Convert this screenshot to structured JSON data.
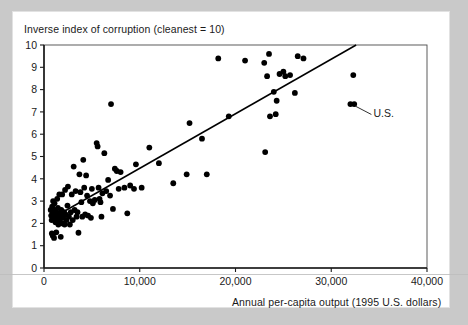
{
  "figure": {
    "background_color": "#ffffff",
    "frame_color": "#c9c9c9",
    "ink_color": "#1a1a1a"
  },
  "chart_data": {
    "type": "scatter",
    "title": "Inverse index of corruption (cleanest = 10)",
    "xlabel": "Annual per-capita output (1995 U.S. dollars)",
    "ylabel": "Inverse index of corruption (cleanest = 10)",
    "xlim": [
      0,
      40000
    ],
    "ylim": [
      0,
      10
    ],
    "xticks": [
      0,
      10000,
      20000,
      30000,
      40000
    ],
    "xticklabels": [
      "0",
      "10,000",
      "20,000",
      "30,000",
      "40,000"
    ],
    "yticks": [
      0,
      1,
      2,
      3,
      4,
      5,
      6,
      7,
      8,
      9,
      10
    ],
    "yticklabels": [
      "0",
      "1",
      "2",
      "3",
      "4",
      "5",
      "6",
      "7",
      "8",
      "9",
      "10"
    ],
    "grid": false,
    "legend": false,
    "marker": {
      "shape": "circle",
      "color": "#000000",
      "size": 4.2
    },
    "trendline": {
      "type": "linear",
      "color": "#000000",
      "x_start": 800,
      "y_start": 2.22,
      "x_end": 32600,
      "y_end": 10.0
    },
    "annotations": [
      {
        "text": "U.S.",
        "points_to_x": 32200,
        "points_to_y": 7.35,
        "label_x": 34400,
        "label_y": 6.75
      }
    ],
    "points": [
      [
        700,
        2.6
      ],
      [
        750,
        2.35
      ],
      [
        800,
        2.15
      ],
      [
        820,
        1.55
      ],
      [
        850,
        2.75
      ],
      [
        900,
        2.45
      ],
      [
        920,
        1.45
      ],
      [
        950,
        3.0
      ],
      [
        980,
        2.25
      ],
      [
        1000,
        2.6
      ],
      [
        1050,
        1.35
      ],
      [
        1100,
        2.9
      ],
      [
        1150,
        2.3
      ],
      [
        1200,
        2.05
      ],
      [
        1250,
        2.55
      ],
      [
        1280,
        1.6
      ],
      [
        1320,
        2.4
      ],
      [
        1380,
        3.1
      ],
      [
        1400,
        2.2
      ],
      [
        1450,
        2.7
      ],
      [
        1500,
        1.95
      ],
      [
        1550,
        2.45
      ],
      [
        1600,
        3.3
      ],
      [
        1650,
        2.15
      ],
      [
        1700,
        2.3
      ],
      [
        1750,
        1.4
      ],
      [
        1800,
        2.6
      ],
      [
        1850,
        2.35
      ],
      [
        1900,
        3.3
      ],
      [
        1950,
        2.0
      ],
      [
        2000,
        2.25
      ],
      [
        2100,
        2.5
      ],
      [
        2150,
        1.95
      ],
      [
        2200,
        3.5
      ],
      [
        2250,
        2.4
      ],
      [
        2350,
        2.15
      ],
      [
        2450,
        2.8
      ],
      [
        2500,
        3.65
      ],
      [
        2600,
        2.3
      ],
      [
        2700,
        1.95
      ],
      [
        2800,
        2.5
      ],
      [
        2900,
        3.3
      ],
      [
        3000,
        2.15
      ],
      [
        3100,
        4.55
      ],
      [
        3200,
        2.6
      ],
      [
        3300,
        3.45
      ],
      [
        3400,
        2.3
      ],
      [
        3500,
        2.5
      ],
      [
        3600,
        1.58
      ],
      [
        3700,
        4.2
      ],
      [
        3800,
        3.4
      ],
      [
        3900,
        2.95
      ],
      [
        4000,
        2.3
      ],
      [
        4100,
        4.85
      ],
      [
        4200,
        3.6
      ],
      [
        4300,
        2.4
      ],
      [
        4400,
        4.15
      ],
      [
        4500,
        3.25
      ],
      [
        4600,
        2.35
      ],
      [
        4800,
        3.0
      ],
      [
        4900,
        2.25
      ],
      [
        5000,
        3.55
      ],
      [
        5100,
        2.9
      ],
      [
        5300,
        3.05
      ],
      [
        5500,
        5.6
      ],
      [
        5600,
        5.45
      ],
      [
        5700,
        3.6
      ],
      [
        5800,
        3.1
      ],
      [
        5900,
        2.95
      ],
      [
        6000,
        2.3
      ],
      [
        6100,
        3.35
      ],
      [
        6300,
        5.15
      ],
      [
        6500,
        3.45
      ],
      [
        6700,
        3.95
      ],
      [
        6900,
        3.25
      ],
      [
        7000,
        7.35
      ],
      [
        7200,
        2.65
      ],
      [
        7400,
        4.45
      ],
      [
        7600,
        4.35
      ],
      [
        7800,
        3.55
      ],
      [
        8000,
        4.3
      ],
      [
        8400,
        3.6
      ],
      [
        8700,
        2.45
      ],
      [
        9000,
        3.7
      ],
      [
        9400,
        3.55
      ],
      [
        9600,
        4.65
      ],
      [
        10200,
        3.6
      ],
      [
        11000,
        5.4
      ],
      [
        12000,
        4.7
      ],
      [
        13500,
        3.8
      ],
      [
        14900,
        4.2
      ],
      [
        15200,
        6.5
      ],
      [
        16500,
        5.8
      ],
      [
        17000,
        4.2
      ],
      [
        18200,
        9.4
      ],
      [
        19300,
        6.8
      ],
      [
        21000,
        9.3
      ],
      [
        23000,
        9.2
      ],
      [
        23100,
        5.2
      ],
      [
        23300,
        8.6
      ],
      [
        23500,
        9.6
      ],
      [
        23600,
        6.8
      ],
      [
        24000,
        7.9
      ],
      [
        24200,
        6.9
      ],
      [
        24300,
        7.5
      ],
      [
        24600,
        8.7
      ],
      [
        25000,
        8.8
      ],
      [
        25200,
        8.6
      ],
      [
        25700,
        8.65
      ],
      [
        26200,
        7.85
      ],
      [
        26500,
        9.5
      ],
      [
        27100,
        9.4
      ],
      [
        32000,
        7.35
      ],
      [
        32400,
        7.35
      ],
      [
        32300,
        8.65
      ]
    ]
  }
}
